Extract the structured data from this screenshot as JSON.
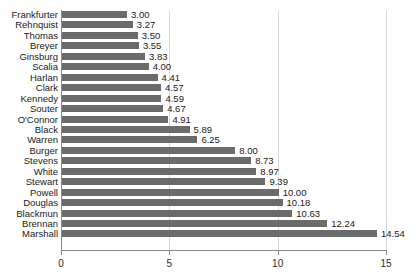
{
  "chart_data": {
    "type": "bar",
    "orientation": "horizontal",
    "title": "",
    "subtitle": "",
    "xlabel": "",
    "ylabel": "",
    "xlim": [
      0,
      15
    ],
    "xticks": [
      0,
      5,
      10,
      15
    ],
    "xtick_labels": [
      "0",
      "5",
      "10",
      "15"
    ],
    "grid": true,
    "grid_axis": "x",
    "legend": false,
    "bar_color": "#6b6b6b",
    "background_color": "#ffffff",
    "axis_color": "#8a8a8a",
    "gridline_color": "#d8d8d8",
    "value_label_format": "0.00",
    "categories": [
      "Frankfurter",
      "Rehnquist",
      "Thomas",
      "Breyer",
      "Ginsburg",
      "Scalia",
      "Harlan",
      "Clark",
      "Kennedy",
      "Souter",
      "O'Connor",
      "Black",
      "Warren",
      "Burger",
      "Stevens",
      "White",
      "Stewart",
      "Powell",
      "Douglas",
      "Blackmun",
      "Brennan",
      "Marshall"
    ],
    "values": [
      3.0,
      3.27,
      3.5,
      3.55,
      3.83,
      4.0,
      4.41,
      4.57,
      4.59,
      4.67,
      4.91,
      5.89,
      6.25,
      8.0,
      8.73,
      8.97,
      9.39,
      10.0,
      10.18,
      10.63,
      12.24,
      14.54
    ],
    "value_labels": [
      "3.00",
      "3.27",
      "3.50",
      "3.55",
      "3.83",
      "4.00",
      "4.41",
      "4.57",
      "4.59",
      "4.67",
      "4.91",
      "5.89",
      "6.25",
      "8.00",
      "8.73",
      "8.97",
      "9.39",
      "10.00",
      "10.18",
      "10.63",
      "12.24",
      "14.54"
    ]
  }
}
